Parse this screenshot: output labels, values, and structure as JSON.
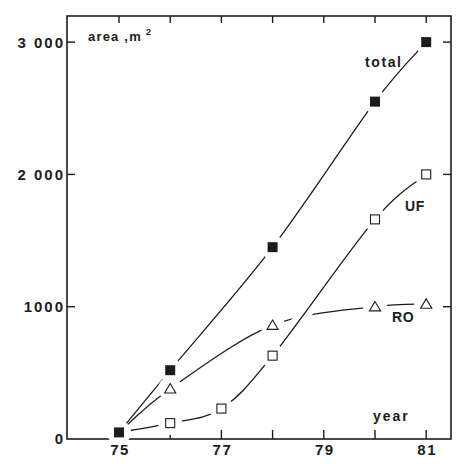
{
  "figure": {
    "background": "#ffffff",
    "ink": "#1c1c1c"
  },
  "chart_data": {
    "type": "line",
    "title": "",
    "xlabel": "year",
    "ylabel": "area, m²",
    "ylabel_parts": {
      "base": "area ,m",
      "sup": "2"
    },
    "xlim": [
      75,
      81
    ],
    "ylim": [
      0,
      3000
    ],
    "grid": false,
    "legend": "inline labels next to curves",
    "x_ticks": [
      75,
      76,
      77,
      78,
      79,
      80,
      81
    ],
    "x_tick_labels": [
      {
        "value": 75,
        "label": "75"
      },
      {
        "value": 77,
        "label": "77"
      },
      {
        "value": 79,
        "label": "79"
      },
      {
        "value": 81,
        "label": "81"
      }
    ],
    "y_ticks": [
      0,
      1000,
      2000,
      3000
    ],
    "y_tick_labels": [
      {
        "value": 0,
        "label": "0"
      },
      {
        "value": 1000,
        "label": "1000"
      },
      {
        "value": 2000,
        "label": "2 000"
      },
      {
        "value": 3000,
        "label": "3 000"
      }
    ],
    "series": [
      {
        "name": "total",
        "marker": "filled-square",
        "x": [
          75,
          76,
          78,
          80,
          81
        ],
        "y": [
          50,
          520,
          1450,
          2550,
          3000
        ]
      },
      {
        "name": "UF",
        "marker": "open-square",
        "x": [
          76,
          77,
          78,
          80,
          81
        ],
        "y": [
          120,
          230,
          630,
          1660,
          2000
        ],
        "line_starts_at": [
          75,
          50
        ]
      },
      {
        "name": "RO",
        "marker": "open-triangle",
        "x": [
          76,
          78,
          80,
          81
        ],
        "y": [
          380,
          860,
          1000,
          1020
        ],
        "line_starts_at": [
          75,
          50
        ]
      }
    ]
  }
}
